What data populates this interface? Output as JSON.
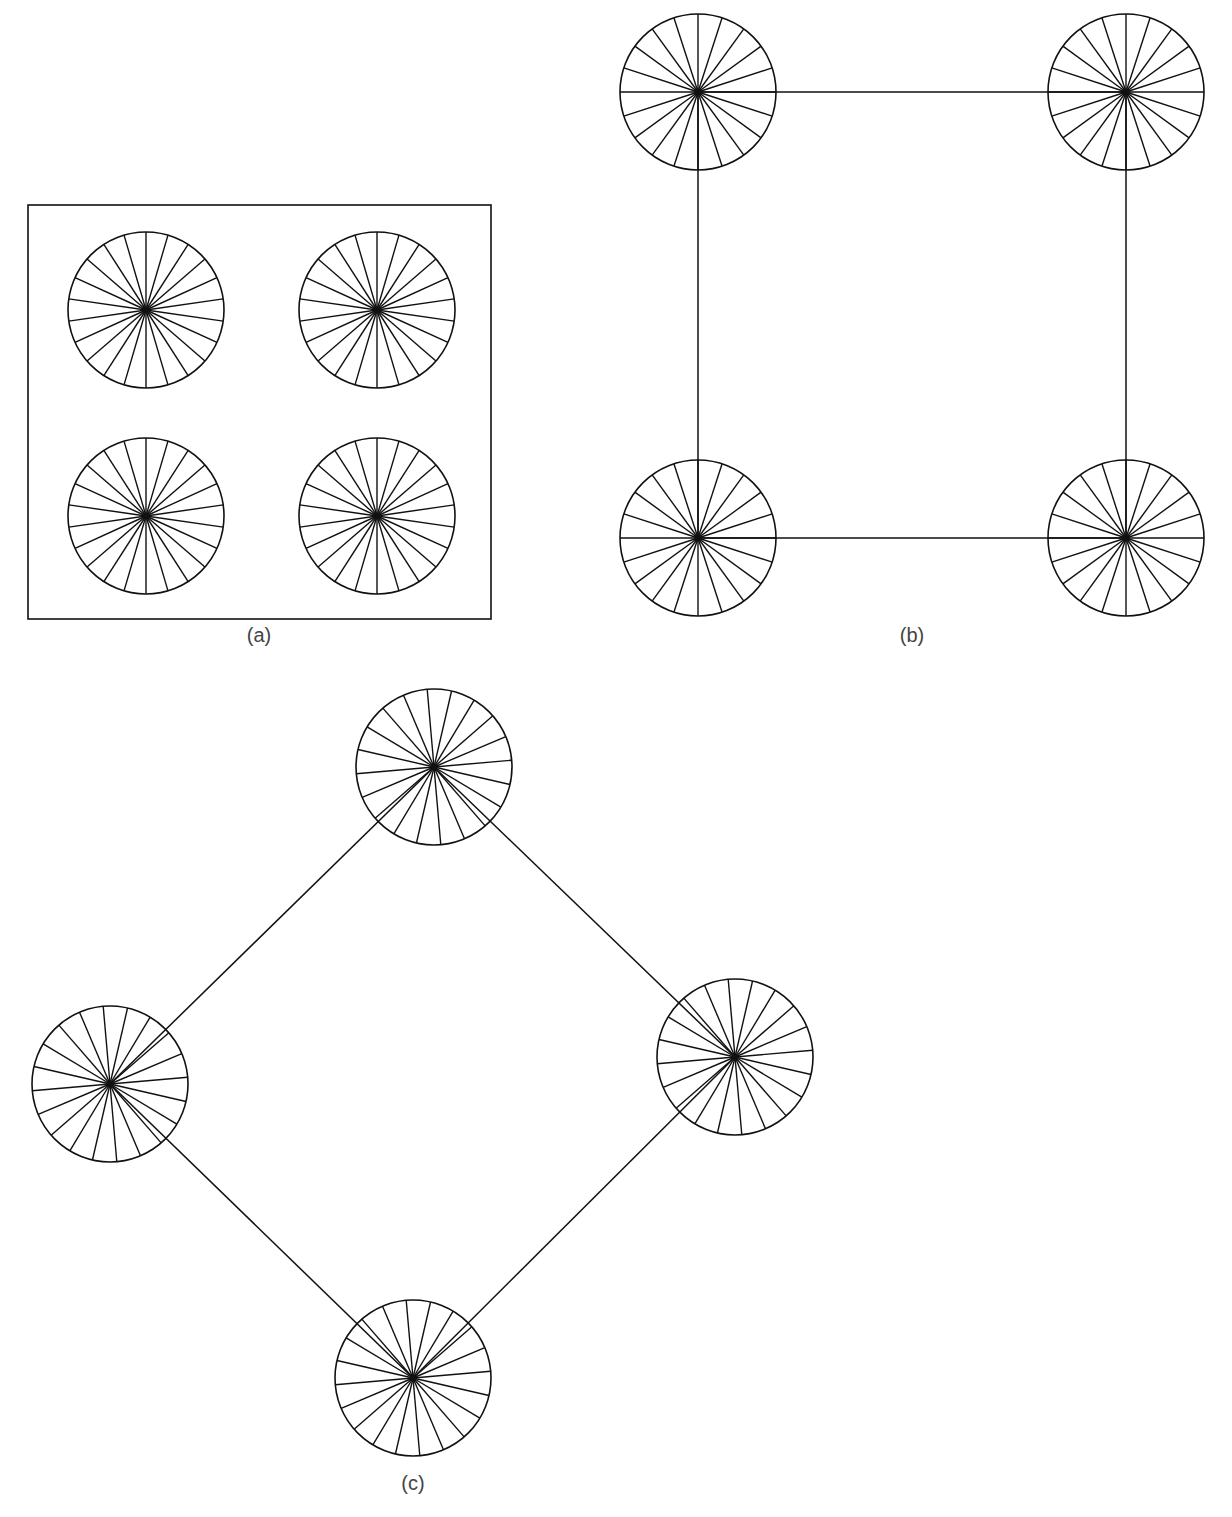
{
  "figure": {
    "stroke_color": "#111111",
    "background": "#ffffff",
    "wheel_radius": 78,
    "panels": [
      {
        "id": "a",
        "label": "(a)",
        "label_pos": [
          259,
          636
        ],
        "frame": {
          "x": 28,
          "y": 205,
          "width": 463,
          "height": 414
        },
        "spokes": 22,
        "spoke_offset_deg": 90,
        "wheels": [
          {
            "cx": 146,
            "cy": 310
          },
          {
            "cx": 377,
            "cy": 310
          },
          {
            "cx": 146,
            "cy": 516
          },
          {
            "cx": 377,
            "cy": 516
          }
        ],
        "edges": []
      },
      {
        "id": "b",
        "label": "(b)",
        "label_pos": [
          912,
          636
        ],
        "frame": null,
        "spokes": 20,
        "spoke_offset_deg": 0,
        "wheels": [
          {
            "cx": 698,
            "cy": 92
          },
          {
            "cx": 1126,
            "cy": 92
          },
          {
            "cx": 698,
            "cy": 538
          },
          {
            "cx": 1126,
            "cy": 538
          }
        ],
        "edges": [
          [
            0,
            1
          ],
          [
            1,
            3
          ],
          [
            3,
            2
          ],
          [
            2,
            0
          ]
        ]
      },
      {
        "id": "c",
        "label": "(c)",
        "label_pos": [
          413,
          1484
        ],
        "frame": null,
        "spokes": 20,
        "spoke_offset_deg": 5,
        "wheels": [
          {
            "cx": 434,
            "cy": 767
          },
          {
            "cx": 735,
            "cy": 1057
          },
          {
            "cx": 413,
            "cy": 1378
          },
          {
            "cx": 110,
            "cy": 1084
          }
        ],
        "edges": [
          [
            0,
            1
          ],
          [
            1,
            2
          ],
          [
            2,
            3
          ],
          [
            3,
            0
          ]
        ]
      }
    ]
  }
}
